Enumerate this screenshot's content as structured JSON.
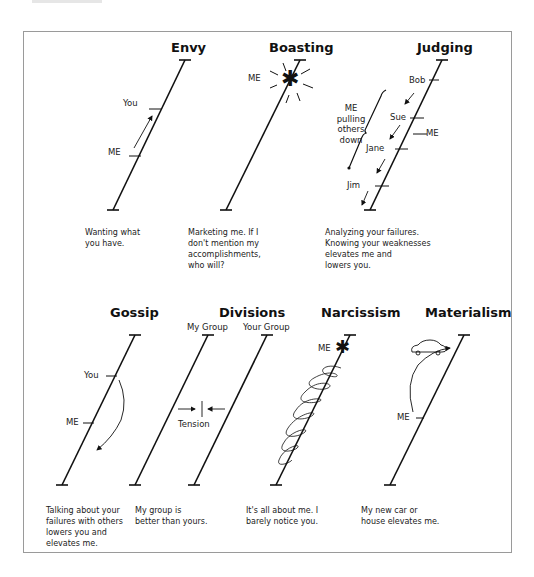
{
  "figure": {
    "panels": [
      {
        "id": "envy",
        "title": "Envy",
        "labels": {
          "you": "You",
          "me": "ME"
        },
        "caption": "Wanting what\nyou have."
      },
      {
        "id": "boasting",
        "title": "Boasting",
        "labels": {
          "me": "ME"
        },
        "caption": "Marketing me. If I\ndon't mention my\naccomplishments,\nwho will?"
      },
      {
        "id": "judging",
        "title": "Judging",
        "labels": {
          "bob": "Bob",
          "sue": "Sue",
          "jane": "Jane",
          "jim": "Jim",
          "me": "ME",
          "bracket": "ME\npulling\nothers\ndown"
        },
        "caption": "Analyzing your failures.\nKnowing your weaknesses\nelevates me and\nlowers you."
      },
      {
        "id": "gossip",
        "title": "Gossip",
        "labels": {
          "you": "You",
          "me": "ME"
        },
        "caption": "Talking about your\nfailures with others\nlowers you and\nelevates me."
      },
      {
        "id": "divisions",
        "title": "Divisions",
        "labels": {
          "my_group": "My Group",
          "your_group": "Your Group",
          "tension": "Tension"
        },
        "caption": "My group is\nbetter than yours."
      },
      {
        "id": "narcissism",
        "title": "Narcissism",
        "labels": {
          "me": "ME"
        },
        "caption": "It's all about me. I\nbarely notice you."
      },
      {
        "id": "materialism",
        "title": "Materialism",
        "labels": {
          "me": "ME"
        },
        "caption": "My new car or\nhouse elevates me."
      }
    ]
  },
  "colors": {
    "ink": "#111111",
    "text": "#222222",
    "frame": "#9a9a9a",
    "background": "#ffffff"
  }
}
